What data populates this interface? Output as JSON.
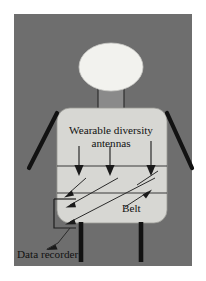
{
  "figure": {
    "panel": {
      "background_color": "#6e6e6e",
      "page_color": "#ffffff"
    },
    "body": {
      "head_color": "#f2f2ee",
      "torso_color": "#d7d7d3",
      "limb_color": "#121212",
      "outline_color": "#4a4a4a"
    },
    "labels": {
      "antennas_line1": "Wearable diversity",
      "antennas_line2": "antennas",
      "belt": "Belt",
      "data_recorder": "Data recorder"
    },
    "annotations": {
      "antenna_arrow_count": 3,
      "signal_arrow_count": 3,
      "belt_band_lines": 2,
      "leg_count": 2,
      "arm_count": 2
    }
  }
}
